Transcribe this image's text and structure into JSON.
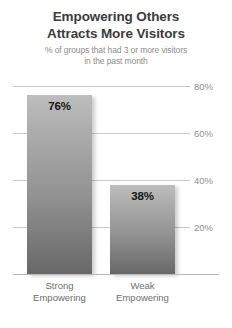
{
  "chart_data": {
    "type": "bar",
    "title": "Empowering Others Attracts More Visitors",
    "title_line1": "Empowering Others",
    "title_line2": "Attracts More Visitors",
    "subtitle_line1": "% of groups that had 3 or more visitors",
    "subtitle_line2": "in the past month",
    "xlabel": "",
    "ylabel": "",
    "ylim": [
      0,
      80
    ],
    "grid": true,
    "legend": "none",
    "categories": [
      "Strong Empowering",
      "Weak Empowering"
    ],
    "values": [
      76,
      38
    ],
    "value_labels": [
      "76%",
      "38%"
    ],
    "ticks": [
      {
        "value": 80,
        "label": "80%"
      },
      {
        "value": 60,
        "label": "60%"
      },
      {
        "value": 40,
        "label": "40%"
      },
      {
        "value": 20,
        "label": "20%"
      }
    ],
    "bars": [
      {
        "category_line1": "Strong",
        "category_line2": "Empowering",
        "value": 76,
        "value_label": "76%"
      },
      {
        "category_line1": "Weak",
        "category_line2": "Empowering",
        "value": 38,
        "value_label": "38%"
      }
    ],
    "colors": {
      "bar_top": "#bdbdbd",
      "bar_bottom": "#686868",
      "title": "#3b3b3b",
      "subtitle": "#8d8d8d",
      "tick_label": "#8f8f8f",
      "gridline": "#c9c9c9",
      "value_label": "#141414",
      "category_label": "#6e6e6e",
      "background": "#ffffff"
    }
  }
}
